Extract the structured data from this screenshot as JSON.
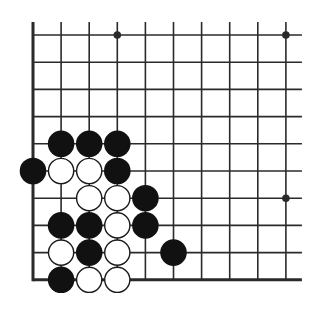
{
  "diagram": {
    "type": "go-board",
    "colors": {
      "background": "#ffffff",
      "line": "#2a2a2a",
      "black_stone": "#111111",
      "white_stone_fill": "#ffffff",
      "white_stone_outline": "#1a1a1a"
    },
    "grid": {
      "columns": 10,
      "rows": 10,
      "x0": 33,
      "y0": 35,
      "spacing_x": 28.1,
      "spacing_y": 27.2,
      "left_edge": true,
      "bottom_edge": true,
      "top_edge": false,
      "right_edge": false
    },
    "hoshi": [
      {
        "col": 4,
        "row": 1
      },
      {
        "col": 10,
        "row": 1
      },
      {
        "col": 10,
        "row": 7
      }
    ],
    "stones": [
      {
        "color": "black",
        "col": 2,
        "row": 5
      },
      {
        "color": "black",
        "col": 3,
        "row": 5
      },
      {
        "color": "black",
        "col": 4,
        "row": 5
      },
      {
        "color": "black",
        "col": 1,
        "row": 6
      },
      {
        "color": "white",
        "col": 2,
        "row": 6
      },
      {
        "color": "white",
        "col": 3,
        "row": 6
      },
      {
        "color": "black",
        "col": 4,
        "row": 6
      },
      {
        "color": "white",
        "col": 3,
        "row": 7
      },
      {
        "color": "white",
        "col": 4,
        "row": 7
      },
      {
        "color": "black",
        "col": 5,
        "row": 7
      },
      {
        "color": "black",
        "col": 2,
        "row": 8
      },
      {
        "color": "black",
        "col": 3,
        "row": 8
      },
      {
        "color": "white",
        "col": 4,
        "row": 8
      },
      {
        "color": "black",
        "col": 5,
        "row": 8
      },
      {
        "color": "white",
        "col": 2,
        "row": 9
      },
      {
        "color": "black",
        "col": 3,
        "row": 9
      },
      {
        "color": "white",
        "col": 4,
        "row": 9
      },
      {
        "color": "black",
        "col": 6,
        "row": 9
      },
      {
        "color": "black",
        "col": 2,
        "row": 10
      },
      {
        "color": "white",
        "col": 3,
        "row": 10
      },
      {
        "color": "white",
        "col": 4,
        "row": 10
      }
    ]
  }
}
